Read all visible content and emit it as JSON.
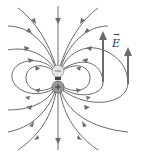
{
  "diagram": {
    "type": "electric-dipole-field-lines",
    "charges": [
      {
        "sign": "negative",
        "symbol": "−",
        "color": "#e6e6e6"
      },
      {
        "sign": "positive",
        "symbol": "+",
        "color": "#9a9a9a"
      }
    ],
    "field_vector_label": "E",
    "vector_arrow": "→",
    "line_color": "#6b6b6b"
  }
}
